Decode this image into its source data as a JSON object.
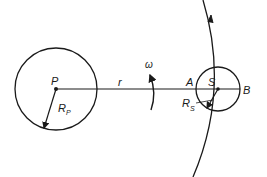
{
  "diagram": {
    "labels": {
      "planet": "P",
      "planet_radius": "R",
      "planet_radius_sub": "P",
      "distance": "r",
      "angular_velocity": "ω",
      "near_point": "A",
      "satellite": "S",
      "far_point": "B",
      "satellite_radius": "R",
      "satellite_radius_sub": "S"
    },
    "colors": {
      "stroke": "#1a1a1a",
      "background": "#ffffff"
    }
  }
}
